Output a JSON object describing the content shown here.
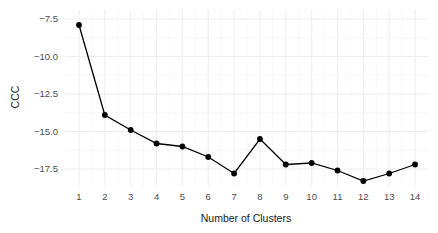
{
  "chart_data": {
    "type": "line",
    "title": "",
    "xlabel": "Number of Clusters",
    "ylabel": "CCC",
    "x": [
      1,
      2,
      3,
      4,
      5,
      6,
      7,
      8,
      9,
      10,
      11,
      12,
      13,
      14
    ],
    "series": [
      {
        "name": "CCC",
        "values": [
          -7.9,
          -13.9,
          -14.9,
          -15.8,
          -16.0,
          -16.7,
          -17.8,
          -15.5,
          -17.2,
          -17.1,
          -17.6,
          -18.3,
          -17.8,
          -17.2
        ]
      }
    ],
    "xticks": [
      "1",
      "2",
      "3",
      "4",
      "5",
      "6",
      "7",
      "8",
      "9",
      "10",
      "11",
      "12",
      "13",
      "14"
    ],
    "yticks": [
      -7.5,
      -10.0,
      -12.5,
      -15.0,
      -17.5
    ],
    "ytick_labels": [
      "-7.5",
      "-10.0",
      "-12.5",
      "-15.0",
      "-17.5"
    ],
    "xlim": [
      0.6,
      14.5
    ],
    "ylim": [
      -18.6,
      -7.0
    ],
    "grid": true,
    "legend": "none",
    "colors": {
      "line": "#000000",
      "point": "#000000",
      "grid": "#ebebeb",
      "background": "#ffffff"
    }
  }
}
